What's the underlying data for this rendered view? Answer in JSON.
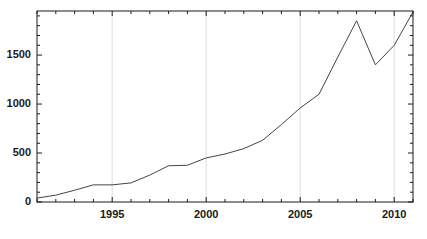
{
  "chart_data": {
    "type": "line",
    "title": "",
    "subtitle": "",
    "xlabel": "",
    "ylabel": "",
    "xlim": [
      1991,
      2011
    ],
    "ylim": [
      0,
      1950
    ],
    "grid": "vertical-major-only",
    "legend": "none",
    "x_tick_labels": [
      "1995",
      "2000",
      "2005",
      "2010"
    ],
    "x_tick_values": [
      1995,
      2000,
      2005,
      2010
    ],
    "x_minor_tick_step": 1,
    "y_tick_labels": [
      "0",
      "500",
      "1000",
      "1500"
    ],
    "y_tick_values": [
      0,
      500,
      1000,
      1500
    ],
    "y_minor_tick_step": 100,
    "series": [
      {
        "name": "series-1",
        "color": "#444444",
        "x": [
          1991,
          1992,
          1993,
          1994,
          1995,
          1996,
          1997,
          1998,
          1999,
          2000,
          2001,
          2002,
          2003,
          2004,
          2005,
          2006,
          2007,
          2008,
          2009,
          2010,
          2011
        ],
        "values": [
          40,
          70,
          120,
          175,
          175,
          195,
          275,
          370,
          375,
          450,
          490,
          545,
          630,
          790,
          960,
          1100,
          1480,
          1850,
          1400,
          1600,
          1940
        ]
      }
    ]
  },
  "axes": {
    "frame_color": "#1a1a1a",
    "gridline_color": "#dcdcdc",
    "tick_color": "#1a1a1a"
  }
}
